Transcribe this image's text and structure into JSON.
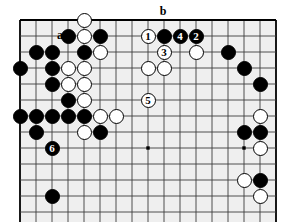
{
  "diagram": {
    "kind": "go-board-problem-diagram",
    "title": "",
    "board": {
      "cols": 17,
      "rows": 13,
      "origin_x": 20,
      "origin_y": 20,
      "spacing": 16,
      "grid_color": "#3c3c3c",
      "border_color": "#000000",
      "background": "#efefef",
      "page_background": "#ffffff",
      "edges": {
        "top": true,
        "left": true,
        "right": true,
        "bottom": false
      },
      "star_points": [
        {
          "col": 2,
          "row": 8
        },
        {
          "col": 8,
          "row": 8
        },
        {
          "col": 14,
          "row": 8
        }
      ]
    },
    "stone_diameter": 15,
    "stones": [
      {
        "col": 0,
        "row": 3,
        "color": "black",
        "number": null
      },
      {
        "col": 0,
        "row": 6,
        "color": "black",
        "number": null
      },
      {
        "col": 1,
        "row": 2,
        "color": "black",
        "number": null
      },
      {
        "col": 1,
        "row": 6,
        "color": "black",
        "number": null
      },
      {
        "col": 1,
        "row": 7,
        "color": "black",
        "number": null
      },
      {
        "col": 2,
        "row": 2,
        "color": "black",
        "number": null
      },
      {
        "col": 2,
        "row": 3,
        "color": "black",
        "number": null
      },
      {
        "col": 2,
        "row": 4,
        "color": "black",
        "number": null
      },
      {
        "col": 2,
        "row": 6,
        "color": "black",
        "number": null
      },
      {
        "col": 2,
        "row": 8,
        "color": "black",
        "number": "6"
      },
      {
        "col": 2,
        "row": 11,
        "color": "black",
        "number": null
      },
      {
        "col": 3,
        "row": 1,
        "color": "black",
        "number": null
      },
      {
        "col": 3,
        "row": 5,
        "color": "black",
        "number": null
      },
      {
        "col": 3,
        "row": 6,
        "color": "black",
        "number": null
      },
      {
        "col": 4,
        "row": 0,
        "color": "white",
        "number": null
      },
      {
        "col": 4,
        "row": 1,
        "color": "white",
        "number": null
      },
      {
        "col": 4,
        "row": 2,
        "color": "black",
        "number": null
      },
      {
        "col": 4,
        "row": 3,
        "color": "white",
        "number": null
      },
      {
        "col": 4,
        "row": 4,
        "color": "white",
        "number": null
      },
      {
        "col": 4,
        "row": 5,
        "color": "white",
        "number": null
      },
      {
        "col": 4,
        "row": 6,
        "color": "black",
        "number": null
      },
      {
        "col": 4,
        "row": 7,
        "color": "white",
        "number": null
      },
      {
        "col": 3,
        "row": 3,
        "color": "white",
        "number": null
      },
      {
        "col": 3,
        "row": 4,
        "color": "white",
        "number": null
      },
      {
        "col": 5,
        "row": 1,
        "color": "black",
        "number": null
      },
      {
        "col": 5,
        "row": 2,
        "color": "white",
        "number": null
      },
      {
        "col": 5,
        "row": 6,
        "color": "white",
        "number": null
      },
      {
        "col": 5,
        "row": 7,
        "color": "black",
        "number": null
      },
      {
        "col": 6,
        "row": 6,
        "color": "white",
        "number": null
      },
      {
        "col": 8,
        "row": 5,
        "color": "white",
        "number": "5"
      },
      {
        "col": 8,
        "row": 1,
        "color": "white",
        "number": "1"
      },
      {
        "col": 8,
        "row": 3,
        "color": "white",
        "number": null
      },
      {
        "col": 9,
        "row": 1,
        "color": "black",
        "number": null
      },
      {
        "col": 9,
        "row": 2,
        "color": "white",
        "number": "3"
      },
      {
        "col": 9,
        "row": 3,
        "color": "white",
        "number": null
      },
      {
        "col": 10,
        "row": 1,
        "color": "black",
        "number": "4"
      },
      {
        "col": 11,
        "row": 1,
        "color": "black",
        "number": "2"
      },
      {
        "col": 11,
        "row": 2,
        "color": "white",
        "number": null
      },
      {
        "col": 13,
        "row": 2,
        "color": "black",
        "number": null
      },
      {
        "col": 14,
        "row": 3,
        "color": "black",
        "number": null
      },
      {
        "col": 15,
        "row": 4,
        "color": "black",
        "number": null
      },
      {
        "col": 15,
        "row": 6,
        "color": "white",
        "number": null
      },
      {
        "col": 14,
        "row": 7,
        "color": "black",
        "number": null
      },
      {
        "col": 15,
        "row": 7,
        "color": "black",
        "number": null
      },
      {
        "col": 15,
        "row": 8,
        "color": "white",
        "number": null
      },
      {
        "col": 14,
        "row": 10,
        "color": "white",
        "number": null
      },
      {
        "col": 15,
        "row": 10,
        "color": "black",
        "number": null
      },
      {
        "col": 15,
        "row": 11,
        "color": "white",
        "number": null
      }
    ],
    "labels": [
      {
        "text": "a",
        "col": 3,
        "row": 1,
        "dx": -8,
        "dy": -1
      },
      {
        "text": "b",
        "col": 9,
        "row": 0,
        "dx": -1,
        "dy": -9
      }
    ],
    "move_numbers": [
      "1",
      "2",
      "3",
      "4",
      "5",
      "6"
    ]
  }
}
